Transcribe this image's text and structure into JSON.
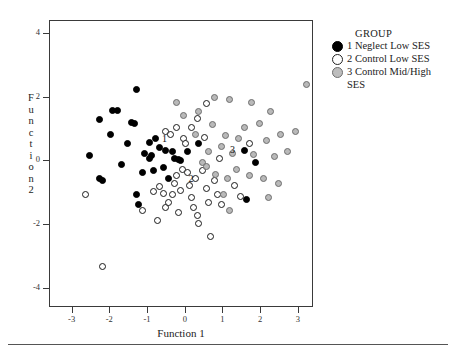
{
  "chart_data": {
    "type": "scatter",
    "title": "",
    "xlabel": "Function 1",
    "ylabel": "Function 2",
    "xlim": [
      -3.6,
      3.4
    ],
    "ylim": [
      -4.6,
      4.4
    ],
    "xticks": [
      -3,
      -2,
      -1,
      0,
      1,
      2,
      3
    ],
    "yticks": [
      4,
      2,
      0,
      -2,
      -4
    ],
    "xtick_labels": [
      "-3",
      "-2",
      "-1",
      "0",
      "1",
      "2",
      "3"
    ],
    "ytick_labels": [
      "4",
      "2",
      "0",
      "-2",
      "-4"
    ],
    "grid": false,
    "legend_position": "right",
    "legend_title": "GROUP",
    "series": [
      {
        "name": "1 Neglect Low SES",
        "marker": "filled-black-circle",
        "color": "#000000",
        "points": [
          [
            -1.3,
            2.25
          ],
          [
            -1.95,
            1.6
          ],
          [
            -1.8,
            1.58
          ],
          [
            -2.3,
            1.3
          ],
          [
            -1.45,
            1.22
          ],
          [
            -1.35,
            1.18
          ],
          [
            -2.0,
            0.85
          ],
          [
            -1.55,
            0.55
          ],
          [
            -0.95,
            0.6
          ],
          [
            -0.8,
            0.7
          ],
          [
            -1.1,
            0.25
          ],
          [
            -0.9,
            0.18
          ],
          [
            -0.95,
            0.1
          ],
          [
            -2.55,
            0.18
          ],
          [
            -2.3,
            -0.55
          ],
          [
            -2.2,
            -0.6
          ],
          [
            -1.15,
            -0.35
          ],
          [
            -0.7,
            0.42
          ],
          [
            -0.55,
            0.35
          ],
          [
            -0.35,
            0.3
          ],
          [
            -0.3,
            0.1
          ],
          [
            -0.2,
            0.05
          ],
          [
            -0.15,
            0.02
          ],
          [
            0.05,
            0.3
          ],
          [
            -0.6,
            -0.2
          ],
          [
            -0.85,
            -0.3
          ],
          [
            -1.3,
            -1.05
          ],
          [
            -1.25,
            -1.35
          ],
          [
            0.35,
            0.55
          ],
          [
            1.55,
            0.35
          ],
          [
            1.85,
            -0.05
          ],
          [
            1.6,
            -1.2
          ],
          [
            -1.7,
            -0.1
          ],
          [
            -0.45,
            -0.55
          ]
        ]
      },
      {
        "name": "2 Control Low SES",
        "marker": "open-circle",
        "color": "#ffffff",
        "points": [
          [
            -2.65,
            -1.05
          ],
          [
            -2.2,
            -3.3
          ],
          [
            -1.15,
            -1.55
          ],
          [
            -0.85,
            -0.95
          ],
          [
            -0.7,
            -0.8
          ],
          [
            -0.6,
            -1.0
          ],
          [
            -0.55,
            -1.45
          ],
          [
            -0.45,
            -1.3
          ],
          [
            -0.35,
            -1.05
          ],
          [
            -0.3,
            -0.7
          ],
          [
            -0.25,
            -0.45
          ],
          [
            -0.2,
            -1.6
          ],
          [
            -0.15,
            -0.9
          ],
          [
            -0.1,
            -0.25
          ],
          [
            -0.05,
            0.7
          ],
          [
            0.0,
            0.55
          ],
          [
            0.05,
            -0.35
          ],
          [
            0.1,
            -0.75
          ],
          [
            0.15,
            -1.15
          ],
          [
            0.2,
            -1.45
          ],
          [
            0.25,
            -0.55
          ],
          [
            0.3,
            -1.7
          ],
          [
            0.35,
            -1.95
          ],
          [
            0.45,
            -0.3
          ],
          [
            0.5,
            0.75
          ],
          [
            0.55,
            -0.85
          ],
          [
            0.6,
            -1.3
          ],
          [
            0.65,
            -2.35
          ],
          [
            0.75,
            -0.6
          ],
          [
            0.85,
            -1.05
          ],
          [
            0.95,
            -1.35
          ],
          [
            -0.55,
            0.95
          ],
          [
            -0.25,
            1.05
          ],
          [
            0.15,
            1.05
          ],
          [
            0.3,
            1.35
          ],
          [
            0.55,
            1.8
          ],
          [
            1.3,
            -0.75
          ],
          [
            1.45,
            -1.1
          ],
          [
            1.7,
            0.55
          ],
          [
            -0.75,
            -1.85
          ],
          [
            -0.4,
            0.85
          ],
          [
            0.9,
            0.1
          ]
        ]
      },
      {
        "name": "3 Control Mid/High SES",
        "marker": "gray-filled-circle",
        "color": "#bdbdbd",
        "points": [
          [
            -0.25,
            1.85
          ],
          [
            0.35,
            1.55
          ],
          [
            0.75,
            2.0
          ],
          [
            1.15,
            1.95
          ],
          [
            1.75,
            1.85
          ],
          [
            2.25,
            1.55
          ],
          [
            1.95,
            1.2
          ],
          [
            1.55,
            1.05
          ],
          [
            2.5,
            0.85
          ],
          [
            2.15,
            0.65
          ],
          [
            1.4,
            0.7
          ],
          [
            1.05,
            0.8
          ],
          [
            0.7,
            1.15
          ],
          [
            0.95,
            0.45
          ],
          [
            1.25,
            0.25
          ],
          [
            1.8,
            0.2
          ],
          [
            2.35,
            0.15
          ],
          [
            2.7,
            0.3
          ],
          [
            1.35,
            -0.25
          ],
          [
            1.7,
            -0.45
          ],
          [
            2.05,
            -0.55
          ],
          [
            2.45,
            -0.7
          ],
          [
            1.1,
            -0.55
          ],
          [
            0.8,
            -0.4
          ],
          [
            0.6,
            0.3
          ],
          [
            0.45,
            -0.05
          ],
          [
            1.0,
            -1.05
          ],
          [
            2.2,
            -1.15
          ],
          [
            0.25,
            0.85
          ],
          [
            3.2,
            2.4
          ],
          [
            2.9,
            0.95
          ],
          [
            1.15,
            -1.55
          ],
          [
            0.55,
            -0.15
          ],
          [
            -0.05,
            1.45
          ]
        ]
      }
    ],
    "centroids": [
      {
        "label": "1",
        "x": -0.55,
        "y": 0.7
      },
      {
        "label": "2",
        "x": 0.15,
        "y": -0.55
      },
      {
        "label": "3",
        "x": 1.25,
        "y": 0.35
      }
    ]
  },
  "axes": {
    "x_title": "Function 1",
    "y_title_letters": [
      "F",
      "u",
      "n",
      "c",
      "t",
      "i",
      "o",
      "n",
      "2"
    ],
    "x_tick_labels": [
      "-3",
      "-2",
      "-1",
      "0",
      "1",
      "2",
      "3"
    ],
    "y_tick_labels": [
      "4",
      "2",
      "0",
      "-2",
      "-4"
    ]
  },
  "legend": {
    "title": "GROUP",
    "entries": [
      {
        "marker": "filled-black-circle",
        "label": "1 Neglect Low SES"
      },
      {
        "marker": "open-circle",
        "label": "2 Control Low SES"
      },
      {
        "marker": "gray-filled-circle",
        "label": "3 Control Mid/High"
      },
      {
        "marker": "none",
        "label": "SES"
      }
    ]
  },
  "colors": {
    "group1": "#000000",
    "group2": "#ffffff",
    "group3": "#bdbdbd",
    "frame": "#3a3a3a",
    "text": "#222222"
  }
}
